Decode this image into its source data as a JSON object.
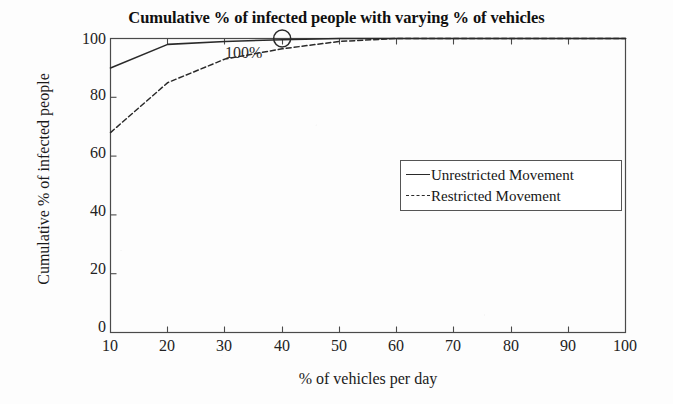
{
  "chart_data": {
    "type": "line",
    "title": "Cumulative % of infected people with varying % of vehicles",
    "xlabel": "% of vehicles per day",
    "ylabel": "Cumulative % of infected people",
    "xlim": [
      10,
      100
    ],
    "ylim": [
      0,
      100
    ],
    "grid": false,
    "legend_position": "center-right",
    "xticks": [
      10,
      20,
      30,
      40,
      50,
      60,
      70,
      80,
      90,
      100
    ],
    "yticks": [
      0,
      20,
      40,
      60,
      80,
      100
    ],
    "x": [
      10,
      20,
      30,
      40,
      50,
      60,
      70,
      80,
      90,
      100
    ],
    "series": [
      {
        "name": "Unrestricted Movement",
        "style": "solid",
        "color": "#2a2a2a",
        "values": [
          90,
          98,
          99,
          99.6,
          100,
          100,
          100,
          100,
          100,
          100
        ]
      },
      {
        "name": "Restricted Movement",
        "style": "dashed",
        "color": "#2a2a2a",
        "values": [
          68,
          85,
          93,
          96.5,
          99,
          100,
          100,
          100,
          100,
          100
        ]
      }
    ],
    "annotations": [
      {
        "text": "100%",
        "marker": "circle",
        "x": 40,
        "y": 100
      }
    ]
  },
  "legend": {
    "items": [
      {
        "label": "Unrestricted Movement",
        "style": "solid"
      },
      {
        "label": "Restricted Movement",
        "style": "dashed"
      }
    ]
  }
}
